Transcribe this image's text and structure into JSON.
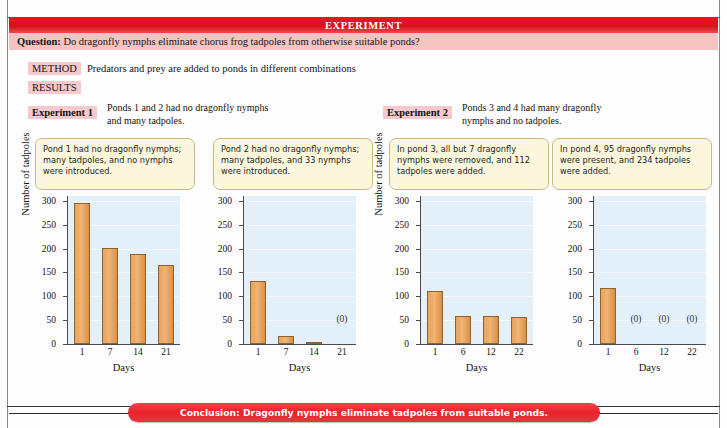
{
  "banner": {
    "title": "EXPERIMENT"
  },
  "question": {
    "label": "Question:",
    "text": "Do dragonfly nymphs eliminate chorus frog tadpoles from otherwise suitable ponds?"
  },
  "method": {
    "label": "METHOD",
    "text": "Predators and prey are added to ponds in different combinations"
  },
  "results": {
    "label": "RESULTS"
  },
  "experiments": [
    {
      "label": "Experiment 1",
      "description": "Ponds 1 and 2 had no dragonfly nymphs and many tadpoles."
    },
    {
      "label": "Experiment 2",
      "description": "Ponds 3 and 4 had many dragonfly nymphs and no tadpoles."
    }
  ],
  "callouts": [
    {
      "text": "Pond 1 had no dragonfly nymphs; many tadpoles, and no nymphs were introduced."
    },
    {
      "text": "Pond 2 had no dragonfly nymphs; many tadpoles, and 33 nymphs were introduced."
    },
    {
      "text": "In pond 3, all but 7 dragonfly nymphs were removed, and 112 tadpoles were added."
    },
    {
      "text": "In pond 4, 95 dragonfly nymphs were present, and 234 tadpoles were added."
    }
  ],
  "conclusion": {
    "text": "Conclusion: Dragonfly nymphs eliminate tadpoles from suitable ponds."
  },
  "colors": {
    "banner_red": "#e8161d",
    "question_pink": "#f6c3c3",
    "tag_pink": "#f6c9cc",
    "callout_yellow": "#fbf7dc",
    "callout_border": "#c8b88a",
    "plot_background": "#e3f0fa",
    "bar_orange": "#e9a25a",
    "bar_border": "#8d6430",
    "axis": "#4a4a4a",
    "conclusion_red": "#e8232b"
  },
  "chart_data": [
    {
      "type": "bar",
      "name": "Pond 1",
      "title": "",
      "xlabel": "Days",
      "ylabel": "Number of tadpoles",
      "categories": [
        "1",
        "7",
        "14",
        "21"
      ],
      "values": [
        296,
        202,
        188,
        166
      ],
      "point_labels": [
        "",
        "",
        "",
        ""
      ],
      "ylim": [
        0,
        310
      ],
      "yticks": [
        0,
        50,
        100,
        150,
        200,
        250,
        300
      ],
      "ytick_labels": [
        "0",
        "50",
        "100",
        "150",
        "200",
        "250",
        "300"
      ],
      "grid": true,
      "legend": "none"
    },
    {
      "type": "bar",
      "name": "Pond 2",
      "title": "",
      "xlabel": "Days",
      "ylabel": "",
      "categories": [
        "1",
        "7",
        "14",
        "21"
      ],
      "values": [
        131,
        17,
        2,
        0
      ],
      "point_labels": [
        "",
        "",
        "",
        "(0)"
      ],
      "ylim": [
        0,
        310
      ],
      "yticks": [
        0,
        50,
        100,
        150,
        200,
        250,
        300
      ],
      "ytick_labels": [
        "0",
        "50",
        "100",
        "150",
        "200",
        "250",
        "300"
      ],
      "grid": true,
      "legend": "none"
    },
    {
      "type": "bar",
      "name": "Pond 3",
      "title": "",
      "xlabel": "Days",
      "ylabel": "Number of tadpoles",
      "categories": [
        "1",
        "6",
        "12",
        "22"
      ],
      "values": [
        112,
        58,
        58,
        57
      ],
      "point_labels": [
        "",
        "",
        "",
        ""
      ],
      "ylim": [
        0,
        310
      ],
      "yticks": [
        0,
        50,
        100,
        150,
        200,
        250,
        300
      ],
      "ytick_labels": [
        "0",
        "50",
        "100",
        "150",
        "200",
        "250",
        "300"
      ],
      "grid": true,
      "legend": "none"
    },
    {
      "type": "bar",
      "name": "Pond 4",
      "title": "",
      "xlabel": "Days",
      "ylabel": "",
      "categories": [
        "1",
        "6",
        "12",
        "22"
      ],
      "values": [
        117,
        0,
        0,
        0
      ],
      "point_labels": [
        "",
        "(0)",
        "(0)",
        "(0)"
      ],
      "ylim": [
        0,
        310
      ],
      "yticks": [
        0,
        50,
        100,
        150,
        200,
        250,
        300
      ],
      "ytick_labels": [
        "0",
        "50",
        "100",
        "150",
        "200",
        "250",
        "300"
      ],
      "grid": true,
      "legend": "none"
    }
  ]
}
